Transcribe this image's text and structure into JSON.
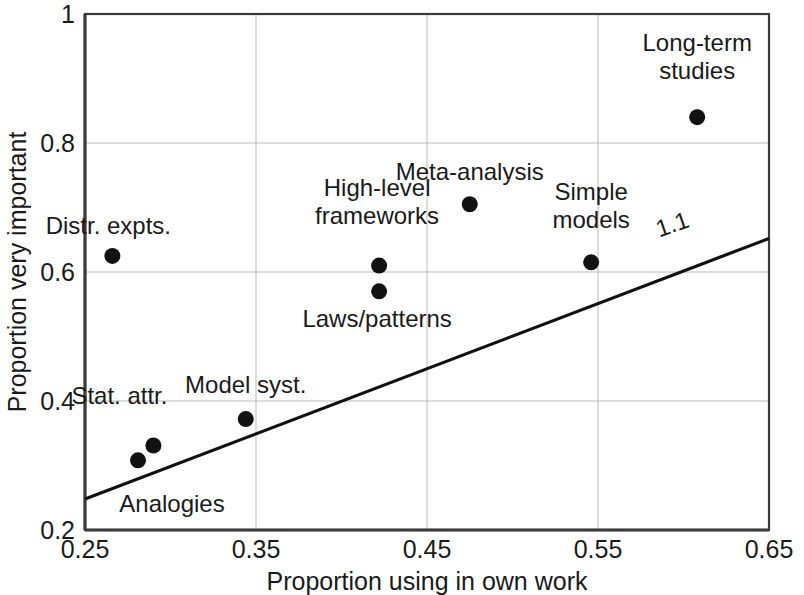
{
  "chart_data": {
    "type": "scatter",
    "title": "",
    "xlabel": "Proportion using in own work",
    "ylabel": "Proportion very important",
    "xlim": [
      0.25,
      0.65
    ],
    "ylim": [
      0.2,
      1
    ],
    "xticks": [
      "0.25",
      "0.35",
      "0.45",
      "0.55",
      "0.65"
    ],
    "xtick_values": [
      0.25,
      0.35,
      0.45,
      0.55,
      0.65
    ],
    "yticks": [
      "0.2",
      "0.4",
      "0.6",
      "0.8",
      "1"
    ],
    "ytick_values": [
      0.2,
      0.4,
      0.6,
      0.8,
      1.0
    ],
    "grid": true,
    "legend": "none",
    "marker_color": "#111111",
    "line_color": "#111111",
    "points": [
      {
        "label": "Distr. expts.",
        "x": 0.266,
        "y": 0.625,
        "label_dx": -4,
        "label_dy": -22,
        "label_anchor": "middle"
      },
      {
        "label": "High-level\nframeworks",
        "x": 0.422,
        "y": 0.61,
        "label_dx": -2,
        "label_dy": -70,
        "label_anchor": "middle"
      },
      {
        "label": "Laws/patterns",
        "x": 0.422,
        "y": 0.57,
        "label_dx": -2,
        "label_dy": 36,
        "label_anchor": "middle"
      },
      {
        "label": "Meta-analysis",
        "x": 0.475,
        "y": 0.705,
        "label_dx": 0,
        "label_dy": -24,
        "label_anchor": "middle"
      },
      {
        "label": "Simple\nmodels",
        "x": 0.546,
        "y": 0.615,
        "label_dx": 0,
        "label_dy": -62,
        "label_anchor": "middle"
      },
      {
        "label": "Long-term\nstudies",
        "x": 0.608,
        "y": 0.84,
        "label_dx": 0,
        "label_dy": -66,
        "label_anchor": "middle"
      },
      {
        "label": "Model syst.",
        "x": 0.344,
        "y": 0.372,
        "label_dx": 0,
        "label_dy": -26,
        "label_anchor": "middle"
      },
      {
        "label": "Stat. attr.",
        "x": 0.29,
        "y": 0.331,
        "label_dx": -34,
        "label_dy": -42,
        "label_anchor": "middle"
      },
      {
        "label": "Analogies",
        "x": 0.281,
        "y": 0.308,
        "label_dx": 34,
        "label_dy": 52,
        "label_anchor": "middle"
      }
    ],
    "trendline": {
      "label": "1.1",
      "x_start": 0.25,
      "y_start": 0.248,
      "x_end": 0.65,
      "y_end": 0.652,
      "label_x": 0.595,
      "label_y": 0.662,
      "label_rotation": -19
    }
  },
  "axis": {
    "x_title": "Proportion using in own work",
    "y_title": "Proportion very important"
  }
}
